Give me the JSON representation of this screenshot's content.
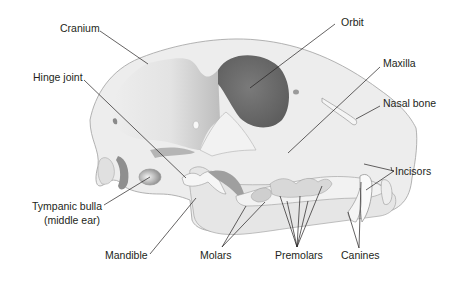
{
  "labels": {
    "cranium": "Cranium",
    "orbit": "Orbit",
    "hinge_joint": "Hinge joint",
    "maxilla": "Maxilla",
    "nasal_bone": "Nasal bone",
    "incisors": "Incisors",
    "tympanic_bulla_line1": "Tympanic bulla",
    "tympanic_bulla_line2": "(middle ear)",
    "mandible": "Mandible",
    "molars": "Molars",
    "premolars": "Premolars",
    "canines": "Canines"
  },
  "colors": {
    "bone": "#ececec",
    "bone_shadow": "#d2d2d2",
    "orbit": "#6e6e6e",
    "outline": "#9a9a9a",
    "leader": "#231f20",
    "text": "#231f20"
  }
}
